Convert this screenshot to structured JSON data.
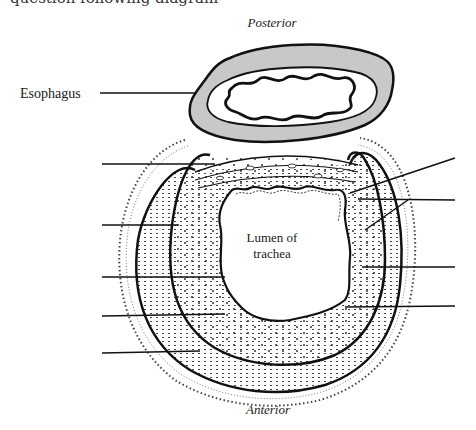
{
  "header": {
    "clipped_text": "question following diagram"
  },
  "diagram": {
    "orientation_top": "Posterior",
    "orientation_bottom": "Anterior",
    "labels": {
      "esophagus": "Esophagus",
      "lumen_line1": "Lumen of",
      "lumen_line2": "trachea"
    },
    "left_blank_leaders": 5,
    "right_blank_leaders": 4,
    "colors": {
      "line": "#111111",
      "esophagus_wall": "#c8c8c8",
      "dots": "#333333"
    }
  }
}
